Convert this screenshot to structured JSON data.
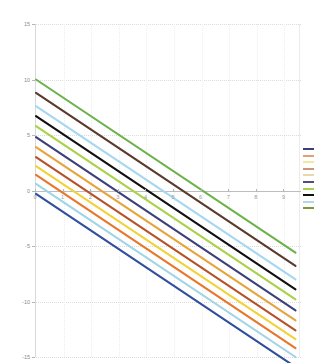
{
  "chart_data": {
    "type": "line",
    "title": "",
    "subtitle": "",
    "xlabel": "",
    "ylabel": "",
    "xlim": [
      0,
      9.6
    ],
    "ylim": [
      -15,
      15
    ],
    "grid": true,
    "legend_position": "right",
    "legend_labels_visible": false,
    "x_ticks": [
      "0",
      "1",
      "2",
      "3",
      "4",
      "5",
      "6",
      "7",
      "8",
      "9"
    ],
    "x_tick_values": [
      0,
      1,
      2,
      3,
      4,
      5,
      6,
      7,
      8,
      9
    ],
    "y_ticks": [
      "15",
      "10",
      "5",
      "0",
      "-5",
      "-10",
      "-15"
    ],
    "y_tick_values": [
      15,
      10,
      5,
      0,
      -5,
      -10,
      -15
    ],
    "x": [
      0,
      9.4
    ],
    "series": [
      {
        "name": "series-1",
        "color": "#6cb24a",
        "values": [
          10.0,
          -5.6
        ]
      },
      {
        "name": "series-2",
        "color": "#5b3a2e",
        "values": [
          8.8,
          -6.8
        ]
      },
      {
        "name": "series-3",
        "color": "#a5d8f0",
        "values": [
          7.6,
          -8.0
        ]
      },
      {
        "name": "series-4",
        "color": "#101010",
        "values": [
          6.7,
          -8.9
        ]
      },
      {
        "name": "series-5",
        "color": "#a8d24a",
        "values": [
          5.8,
          -9.8
        ]
      },
      {
        "name": "series-6",
        "color": "#3c3f7a",
        "values": [
          4.8,
          -10.8
        ]
      },
      {
        "name": "series-7",
        "color": "#e8a33d",
        "values": [
          3.9,
          -11.7
        ]
      },
      {
        "name": "series-8",
        "color": "#b5522a",
        "values": [
          3.0,
          -12.6
        ]
      },
      {
        "name": "series-9",
        "color": "#f2d23a",
        "values": [
          2.2,
          -13.4
        ]
      },
      {
        "name": "series-10",
        "color": "#e8762a",
        "values": [
          1.4,
          -14.2
        ]
      },
      {
        "name": "series-11",
        "color": "#9fd4e8",
        "values": [
          0.6,
          -15.0
        ]
      },
      {
        "name": "series-12",
        "color": "#2f4f9e",
        "values": [
          -0.3,
          -15.9
        ]
      }
    ]
  },
  "legend": {
    "swatches": [
      {
        "name": "legend-swatch-1",
        "color": "#3c3f7a"
      },
      {
        "name": "legend-swatch-2",
        "color": "#e0a070"
      },
      {
        "name": "legend-swatch-3",
        "color": "#f2e8a0"
      },
      {
        "name": "legend-swatch-4",
        "color": "#c89878"
      },
      {
        "name": "legend-swatch-5",
        "color": "#e8d8b0"
      },
      {
        "name": "legend-swatch-6",
        "color": "#5a4a78"
      },
      {
        "name": "legend-swatch-7",
        "color": "#a8d24a"
      },
      {
        "name": "legend-swatch-8",
        "color": "#101010"
      },
      {
        "name": "legend-swatch-9",
        "color": "#b0d8e8"
      },
      {
        "name": "legend-swatch-10",
        "color": "#7a9a3a"
      }
    ]
  }
}
